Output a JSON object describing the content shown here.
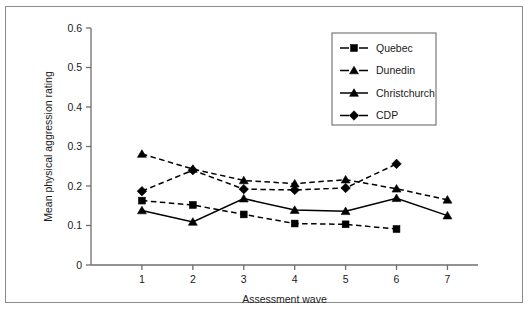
{
  "figure": {
    "background": "#ffffff",
    "border_color": "#8c8c8c",
    "ink_color": "#000000"
  },
  "axes": {
    "x_title": "Assessment wave",
    "y_title": "Mean physical aggression rating",
    "x_ticks": [
      "1",
      "2",
      "3",
      "4",
      "5",
      "6",
      "7"
    ],
    "y_ticks": [
      "0",
      "0.1",
      "0.2",
      "0.3",
      "0.4",
      "0.5",
      "0.6"
    ]
  },
  "legend": {
    "entries": [
      {
        "label": "Quebec",
        "marker": "square",
        "line": "dashed"
      },
      {
        "label": "Dunedin",
        "marker": "triangle",
        "line": "dashed"
      },
      {
        "label": "Christchurch",
        "marker": "triangle",
        "line": "solid"
      },
      {
        "label": "CDP",
        "marker": "diamond",
        "line": "dashed"
      }
    ]
  },
  "chart_data": {
    "type": "line",
    "title": "",
    "xlabel": "Assessment wave",
    "ylabel": "Mean physical aggression rating",
    "xlim": [
      0.0,
      7.6
    ],
    "ylim": [
      0,
      0.6
    ],
    "xticks": [
      1,
      2,
      3,
      4,
      5,
      6,
      7
    ],
    "yticks": [
      0,
      0.1,
      0.2,
      0.3,
      0.4,
      0.5,
      0.6
    ],
    "grid": false,
    "legend_position": "upper-right",
    "series": [
      {
        "name": "Quebec",
        "marker": "square",
        "line": "dashed",
        "x": [
          1,
          2,
          3,
          4,
          5,
          6
        ],
        "values": [
          0.163,
          0.152,
          0.128,
          0.105,
          0.103,
          0.091
        ]
      },
      {
        "name": "Dunedin",
        "marker": "triangle",
        "line": "dashed",
        "x": [
          1,
          2,
          3,
          4,
          5,
          6,
          7
        ],
        "values": [
          0.281,
          0.243,
          0.214,
          0.206,
          0.216,
          0.193,
          0.165
        ]
      },
      {
        "name": "Christchurch",
        "marker": "triangle",
        "line": "solid",
        "x": [
          1,
          2,
          3,
          4,
          5,
          6,
          7
        ],
        "values": [
          0.138,
          0.109,
          0.168,
          0.139,
          0.136,
          0.169,
          0.125
        ]
      },
      {
        "name": "CDP",
        "marker": "diamond",
        "line": "dashed",
        "x": [
          1,
          2,
          3,
          4,
          5,
          6
        ],
        "values": [
          0.187,
          0.24,
          0.192,
          0.19,
          0.195,
          0.256
        ]
      }
    ]
  }
}
